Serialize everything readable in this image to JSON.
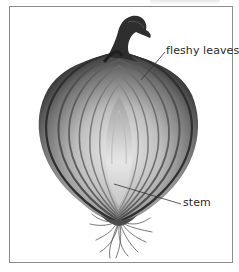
{
  "diagram": {
    "labels": [
      {
        "id": "fleshy-leaves",
        "text": "fleshy leaves"
      },
      {
        "id": "stem",
        "text": "stem"
      }
    ]
  },
  "colors": {
    "frame": "#8c8c8c",
    "label_text": "#2a2a2a",
    "leader_line": "#333333",
    "onion_dark": "#3a3a3a",
    "onion_light": "#e8e8e8"
  }
}
